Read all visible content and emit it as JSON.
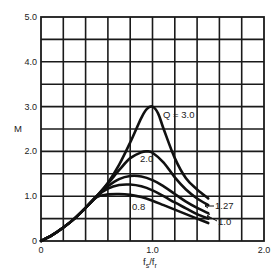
{
  "chart_data": {
    "type": "line",
    "title": "",
    "xlabel": "f_s/f_r",
    "xlabel_main": "f",
    "xlabel_sub1": "s",
    "xlabel_sep": "/f",
    "xlabel_sub2": "r",
    "ylabel": "M",
    "xlim": [
      0,
      2.0
    ],
    "ylim": [
      0,
      5.0
    ],
    "grid": true,
    "x_ticks": [
      {
        "value": 0,
        "label": "0"
      },
      {
        "value": 1.0,
        "label": "1.0"
      },
      {
        "value": 2.0,
        "label": "2.0"
      }
    ],
    "y_ticks": [
      {
        "value": 0,
        "label": "0"
      },
      {
        "value": 1.0,
        "label": "1.0"
      },
      {
        "value": 2.0,
        "label": "2.0"
      },
      {
        "value": 3.0,
        "label": "3.0"
      },
      {
        "value": 4.0,
        "label": "4.0"
      },
      {
        "value": 5.0,
        "label": "5.0"
      }
    ],
    "grid_x_step": 0.2,
    "grid_y_step": 0.5,
    "series": [
      {
        "name": "Q = 3.0",
        "label": "Q = 3.0",
        "x": [
          0,
          0.1,
          0.2,
          0.3,
          0.4,
          0.5,
          0.6,
          0.7,
          0.8,
          0.9,
          0.95,
          1.0,
          1.05,
          1.1,
          1.2,
          1.3,
          1.4,
          1.5
        ],
        "y": [
          0,
          0.13,
          0.3,
          0.5,
          0.74,
          1.0,
          1.3,
          1.7,
          2.2,
          2.75,
          2.95,
          3.0,
          2.85,
          2.5,
          1.85,
          1.4,
          1.15,
          0.95
        ]
      },
      {
        "name": "Q = 2.0",
        "label": "2.0",
        "x": [
          0,
          0.1,
          0.2,
          0.3,
          0.4,
          0.5,
          0.6,
          0.7,
          0.8,
          0.9,
          0.95,
          1.0,
          1.1,
          1.2,
          1.3,
          1.4,
          1.5
        ],
        "y": [
          0,
          0.13,
          0.3,
          0.5,
          0.74,
          1.0,
          1.28,
          1.58,
          1.85,
          1.98,
          2.0,
          1.97,
          1.75,
          1.42,
          1.15,
          0.95,
          0.8
        ]
      },
      {
        "name": "Q = 1.27",
        "label": "1.27",
        "x": [
          0,
          0.1,
          0.2,
          0.3,
          0.4,
          0.5,
          0.6,
          0.7,
          0.8,
          0.9,
          1.0,
          1.1,
          1.2,
          1.3,
          1.4,
          1.5
        ],
        "y": [
          0,
          0.13,
          0.3,
          0.5,
          0.74,
          1.0,
          1.22,
          1.38,
          1.45,
          1.44,
          1.36,
          1.22,
          1.05,
          0.88,
          0.74,
          0.62
        ]
      },
      {
        "name": "Q = 1.0",
        "label": "1.0",
        "x": [
          0,
          0.1,
          0.2,
          0.3,
          0.4,
          0.5,
          0.6,
          0.7,
          0.8,
          0.9,
          1.0,
          1.1,
          1.2,
          1.3,
          1.4,
          1.5
        ],
        "y": [
          0,
          0.13,
          0.3,
          0.5,
          0.74,
          1.0,
          1.17,
          1.25,
          1.26,
          1.22,
          1.13,
          1.0,
          0.86,
          0.73,
          0.6,
          0.5
        ]
      },
      {
        "name": "Q = 0.8",
        "label": "0.8",
        "x": [
          0,
          0.1,
          0.2,
          0.3,
          0.4,
          0.5,
          0.6,
          0.7,
          0.8,
          0.9,
          1.0,
          1.1,
          1.2,
          1.3,
          1.4,
          1.5
        ],
        "y": [
          0,
          0.13,
          0.3,
          0.5,
          0.74,
          0.98,
          1.04,
          1.05,
          1.03,
          0.98,
          0.9,
          0.8,
          0.7,
          0.6,
          0.5,
          0.4
        ]
      }
    ],
    "annotations": [
      {
        "text": "Q = 3.0",
        "series": "Q = 3.0"
      },
      {
        "text": "2.0",
        "series": "Q = 2.0"
      },
      {
        "text": "1.27",
        "series": "Q = 1.27",
        "arrow": true
      },
      {
        "text": "1.0",
        "series": "Q = 1.0",
        "arrow": true
      },
      {
        "text": "0.8",
        "series": "Q = 0.8"
      }
    ]
  }
}
